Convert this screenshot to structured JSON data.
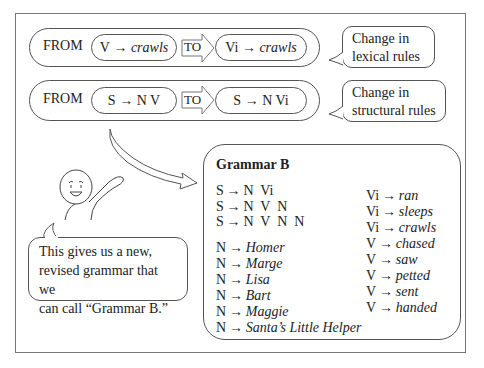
{
  "rows": [
    {
      "from_label": "FROM",
      "from_rule": {
        "lhs": "V",
        "arrow": "→",
        "rhs": "crawls",
        "rhs_italic": true
      },
      "to_label": "TO",
      "to_rule": {
        "lhs": "Vi",
        "arrow": "→",
        "rhs": "crawls",
        "rhs_italic": true
      },
      "callout": {
        "line1": "Change in",
        "line2": "lexical rules"
      }
    },
    {
      "from_label": "FROM",
      "from_rule": {
        "lhs": "S",
        "arrow": "→",
        "rhs": "N V",
        "rhs_italic": false
      },
      "to_label": "TO",
      "to_rule": {
        "lhs": "S",
        "arrow": "→",
        "rhs": "N Vi",
        "rhs_italic": false
      },
      "callout": {
        "line1": "Change in",
        "line2": "structural rules"
      }
    }
  ],
  "speech_bubble": {
    "line1": "This gives us a new,",
    "line2": "revised grammar that we",
    "line3": "can call “Grammar B.”"
  },
  "grammar": {
    "title": "Grammar B",
    "structural_rules": [
      {
        "lhs": "S",
        "arrow": "→",
        "rhs": "N  Vi"
      },
      {
        "lhs": "S",
        "arrow": "→",
        "rhs": "N  V  N"
      },
      {
        "lhs": "S",
        "arrow": "→",
        "rhs": "N  V  N  N"
      }
    ],
    "noun_rules": [
      {
        "lhs": "N",
        "arrow": "→",
        "rhs": "Homer"
      },
      {
        "lhs": "N",
        "arrow": "→",
        "rhs": "Marge"
      },
      {
        "lhs": "N",
        "arrow": "→",
        "rhs": "Lisa"
      },
      {
        "lhs": "N",
        "arrow": "→",
        "rhs": "Bart"
      },
      {
        "lhs": "N",
        "arrow": "→",
        "rhs": "Maggie"
      },
      {
        "lhs": "N",
        "arrow": "→",
        "rhs": "Santa’s Little Helper"
      }
    ],
    "verb_rules": [
      {
        "lhs": "Vi",
        "arrow": "→",
        "rhs": "ran"
      },
      {
        "lhs": "Vi",
        "arrow": "→",
        "rhs": "sleeps"
      },
      {
        "lhs": "Vi",
        "arrow": "→",
        "rhs": "crawls"
      },
      {
        "lhs": "V",
        "arrow": "→",
        "rhs": "chased"
      },
      {
        "lhs": "V",
        "arrow": "→",
        "rhs": "saw"
      },
      {
        "lhs": "V",
        "arrow": "→",
        "rhs": "petted"
      },
      {
        "lhs": "V",
        "arrow": "→",
        "rhs": "sent"
      },
      {
        "lhs": "V",
        "arrow": "→",
        "rhs": "handed"
      }
    ]
  },
  "icons": {
    "to_arrow": "block-right-arrow-icon",
    "curved_arrow": "curved-arrow-icon",
    "character": "smiling-stick-figure-icon"
  },
  "colors": {
    "stroke": "#555555",
    "text": "#222222",
    "background": "#ffffff",
    "frame": "#777777"
  }
}
